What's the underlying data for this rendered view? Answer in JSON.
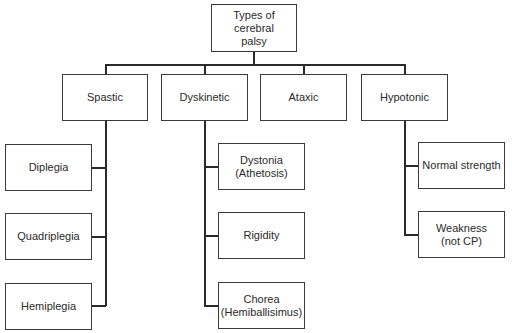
{
  "diagram": {
    "type": "tree",
    "root": {
      "label": "Types of\ncerebral\npalsy"
    },
    "categories": [
      {
        "label": "Spastic",
        "children": [
          {
            "label": "Diplegia"
          },
          {
            "label": "Quadriplegia"
          },
          {
            "label": "Hemiplegia"
          }
        ]
      },
      {
        "label": "Dyskinetic",
        "children": [
          {
            "label": "Dystonia\n(Athetosis)"
          },
          {
            "label": "Rigidity"
          },
          {
            "label": "Chorea\n(Hemiballisimus)"
          }
        ]
      },
      {
        "label": "Ataxic",
        "children": []
      },
      {
        "label": "Hypotonic",
        "children": [
          {
            "label": "Normal strength"
          },
          {
            "label": "Weakness\n(not CP)"
          }
        ]
      }
    ]
  }
}
